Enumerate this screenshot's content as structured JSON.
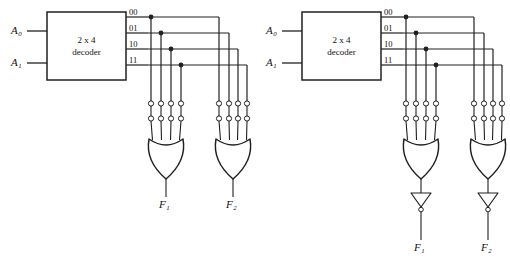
{
  "figure": {
    "background_color": "#ffffff",
    "line_color": "#231f20",
    "text_color": "#111111"
  },
  "circuits": [
    {
      "id": "left-circuit",
      "origin_x": 0,
      "decoder": {
        "title_line1": "2 x 4",
        "title_line2": "decoder",
        "inputs": [
          {
            "label": "A",
            "sub": "0"
          },
          {
            "label": "A",
            "sub": "1"
          }
        ],
        "outputs": [
          "00",
          "01",
          "10",
          "11"
        ]
      },
      "or_gates": [
        {
          "fuse_rows": 2,
          "fuses_per_row": 4,
          "inverted_output": false,
          "output": {
            "label": "F",
            "sub": "1"
          }
        },
        {
          "fuse_rows": 2,
          "fuses_per_row": 4,
          "inverted_output": false,
          "output": {
            "label": "F",
            "sub": "2"
          }
        }
      ]
    },
    {
      "id": "right-circuit",
      "origin_x": 255,
      "decoder": {
        "title_line1": "2 x 4",
        "title_line2": "decoder",
        "inputs": [
          {
            "label": "A",
            "sub": "0"
          },
          {
            "label": "A",
            "sub": "1"
          }
        ],
        "outputs": [
          "00",
          "01",
          "10",
          "11"
        ]
      },
      "or_gates": [
        {
          "fuse_rows": 2,
          "fuses_per_row": 4,
          "inverted_output": true,
          "output": {
            "label": "F",
            "sub": "1"
          }
        },
        {
          "fuse_rows": 2,
          "fuses_per_row": 4,
          "inverted_output": true,
          "output": {
            "label": "F",
            "sub": "2"
          }
        }
      ]
    }
  ]
}
